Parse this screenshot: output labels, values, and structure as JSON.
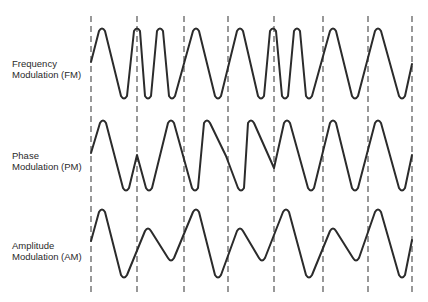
{
  "diagram": {
    "title": "",
    "rows": [
      {
        "id": "fm",
        "line1": "Frequency",
        "line2": "Modulation (FM)"
      },
      {
        "id": "pm",
        "line1": "Phase",
        "line2": "Modulation (PM)"
      },
      {
        "id": "am",
        "line1": "Amplitude",
        "line2": "Modulation (AM)"
      }
    ],
    "bit_boundaries_x": [
      91,
      137,
      184,
      228,
      274,
      323,
      368,
      412
    ],
    "colors": {
      "stroke": "#2b2b2b",
      "dash": "#555555",
      "background": "#ffffff"
    }
  }
}
